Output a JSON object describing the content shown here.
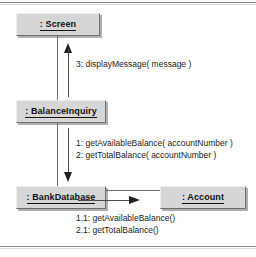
{
  "diagram": {
    "type": "uml-communication-diagram",
    "objects": [
      {
        "id": "screen",
        "name": ": Screen"
      },
      {
        "id": "balanceinquiry",
        "name": ": BalanceInquiry"
      },
      {
        "id": "bankdatabase",
        "name": ": BankDatabase"
      },
      {
        "id": "account",
        "name": ": Account"
      }
    ],
    "links": [
      {
        "id": "link-screen-balance",
        "from": "balanceinquiry",
        "to": "screen",
        "orientation": "vertical"
      },
      {
        "id": "link-balance-bank",
        "from": "balanceinquiry",
        "to": "bankdatabase",
        "orientation": "vertical"
      },
      {
        "id": "link-bank-account",
        "from": "bankdatabase",
        "to": "account",
        "orientation": "horizontal"
      }
    ],
    "messages": [
      {
        "id": "display",
        "from": "balanceinquiry",
        "to": "screen",
        "direction": "up",
        "text": "3: displayMessage( message )",
        "sequence": [
          "3"
        ]
      },
      {
        "id": "getbalances",
        "from": "balanceinquiry",
        "to": "bankdatabase",
        "direction": "down",
        "text": "1: getAvailableBalance( accountNumber )\n2: getTotalBalance( accountNumber )",
        "sequence": [
          "1",
          "2"
        ]
      },
      {
        "id": "accountcalls",
        "from": "bankdatabase",
        "to": "account",
        "direction": "right",
        "text": "1.1: getAvailableBalance()\n2.1: getTotalBalance()",
        "sequence": [
          "1.1",
          "2.1"
        ]
      }
    ],
    "colors": {
      "object_fill": "#d6d6d6",
      "object_border": "#6d6d6d",
      "line": "#6f6f6f",
      "arrow": "#1f1f1f",
      "text": "#1a1a1a",
      "rule": "#8b8b8b",
      "background": "#ffffff"
    }
  }
}
